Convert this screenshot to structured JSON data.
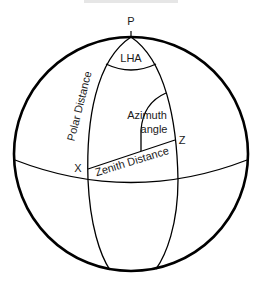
{
  "diagram": {
    "type": "celestial-sphere-navigational-triangle",
    "caption_partial": "",
    "colors": {
      "stroke": "#000000",
      "text": "#1a1a1a",
      "background": "#ffffff"
    },
    "labels": {
      "pole": "P",
      "lha": "LHA",
      "polar_distance": "Polar Distance",
      "azimuth_line1": "Azimuth",
      "azimuth_line2": "angle",
      "zenith": "Z",
      "body": "X",
      "zenith_distance": "Zenith Distance"
    }
  }
}
